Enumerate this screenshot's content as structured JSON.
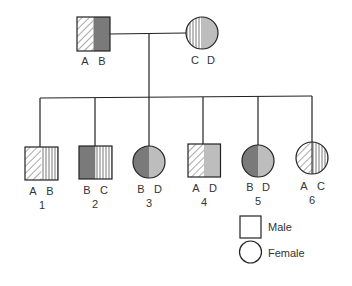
{
  "colors": {
    "line": "#222222",
    "dark_gray": "#7a7a7a",
    "light_gray": "#bdbdbd",
    "hatch": "#555555",
    "text": "#333333"
  },
  "parents": {
    "father": {
      "sex": "male",
      "alleles": [
        "A",
        "B"
      ],
      "fills": [
        "diagonal-hatch",
        "dark-gray"
      ]
    },
    "mother": {
      "sex": "female",
      "alleles": [
        "C",
        "D"
      ],
      "fills": [
        "vertical-hatch",
        "light-gray"
      ]
    }
  },
  "children": [
    {
      "number": "1",
      "sex": "male",
      "alleles": [
        "A",
        "B"
      ],
      "fills": [
        "diagonal-hatch",
        "vertical-hatch"
      ]
    },
    {
      "number": "2",
      "sex": "male",
      "alleles": [
        "B",
        "C"
      ],
      "fills": [
        "dark-gray",
        "vertical-hatch"
      ]
    },
    {
      "number": "3",
      "sex": "female",
      "alleles": [
        "B",
        "D"
      ],
      "fills": [
        "dark-gray",
        "light-gray"
      ]
    },
    {
      "number": "4",
      "sex": "male",
      "alleles": [
        "A",
        "D"
      ],
      "fills": [
        "diagonal-hatch",
        "light-gray"
      ]
    },
    {
      "number": "5",
      "sex": "female",
      "alleles": [
        "B",
        "D"
      ],
      "fills": [
        "dark-gray",
        "light-gray"
      ]
    },
    {
      "number": "6",
      "sex": "female",
      "alleles": [
        "A",
        "C"
      ],
      "fills": [
        "diagonal-hatch",
        "vertical-hatch"
      ]
    }
  ],
  "legend": {
    "male_label": "Male",
    "female_label": "Female"
  }
}
